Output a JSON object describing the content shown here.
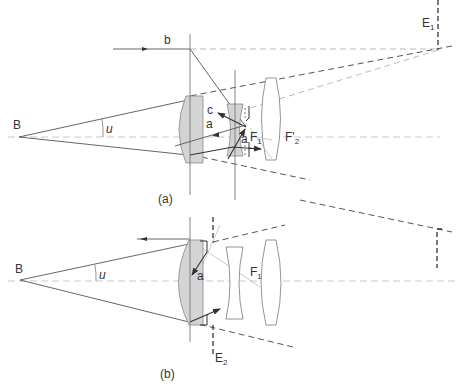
{
  "figure": {
    "panels": [
      {
        "id": "a",
        "caption": "(a)",
        "labels": {
          "object_point": "B",
          "angle": "u",
          "ray_b": "b",
          "ray_c": "c",
          "ray_a1": "a",
          "ray_a2": "a",
          "focal_1": "F",
          "focal_1_sub": "1",
          "focal_2": "F'",
          "focal_2_sub": "2",
          "pupil": "E",
          "pupil_sub": "1"
        }
      },
      {
        "id": "b",
        "caption": "(b)",
        "labels": {
          "object_point": "B",
          "angle": "u",
          "ray_a": "a",
          "focal_1": "F",
          "focal_1_sub": "1",
          "pupil": "E",
          "pupil_sub": "2"
        }
      }
    ]
  },
  "colors": {
    "lens_fill": "#d4d4d4",
    "ray": "#555555",
    "axis": "#bbbbbb"
  }
}
